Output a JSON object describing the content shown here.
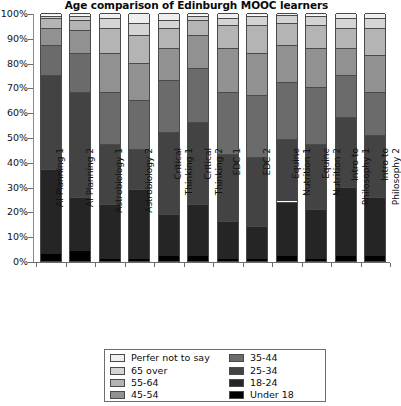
{
  "chart_data": {
    "type": "bar",
    "subtype": "stacked-percentage",
    "title": "Age comparison of Edinburgh MOOC learners",
    "xlabel": "",
    "ylabel": "",
    "ylim": [
      0,
      100
    ],
    "ytick_labels": [
      "100%",
      "90%",
      "80%",
      "70%",
      "60%",
      "50%",
      "40%",
      "30%",
      "20%",
      "10%",
      "0%"
    ],
    "ytick_values": [
      100,
      90,
      80,
      70,
      60,
      50,
      40,
      30,
      20,
      10,
      0
    ],
    "grid": false,
    "legend_position": "bottom",
    "categories": [
      "AI Planning 1",
      "AI Planning 2",
      "Astrobiology 1",
      "Astrobiology 2",
      "Critical Thinking 1",
      "Critical Thinking 2",
      "EDC 1",
      "EDC 2",
      "Equine Nutrition 1",
      "Equine Nutrition 2",
      "Intro to Philosophy 1",
      "Intro to Philosophy 2"
    ],
    "series": [
      {
        "name": "Under 18",
        "color": "#000000",
        "values": [
          3,
          4,
          1,
          1,
          2,
          2,
          1,
          1,
          2,
          1,
          2,
          2
        ]
      },
      {
        "name": "18-24",
        "color": "#252525",
        "values": [
          34,
          22,
          22,
          28,
          17,
          21,
          15,
          13,
          22,
          20,
          28,
          24
        ]
      },
      {
        "name": "25-34",
        "color": "#434343",
        "values": [
          38,
          42,
          24,
          16,
          33,
          33,
          27,
          28,
          25,
          26,
          28,
          25
        ]
      },
      {
        "name": "35-44",
        "color": "#6b6b6b",
        "values": [
          12,
          16,
          21,
          20,
          21,
          22,
          25,
          25,
          23,
          23,
          17,
          17
        ]
      },
      {
        "name": "45-54",
        "color": "#919191",
        "values": [
          7,
          9,
          16,
          15,
          13,
          13,
          18,
          17,
          15,
          16,
          11,
          15
        ]
      },
      {
        "name": "55-64",
        "color": "#b4b4b4",
        "values": [
          4,
          4,
          10,
          11,
          8,
          6,
          9,
          11,
          9,
          9,
          8,
          11
        ]
      },
      {
        "name": "65 over",
        "color": "#d4d4d4",
        "values": [
          1,
          2,
          4,
          5,
          3,
          2,
          3,
          4,
          3,
          4,
          4,
          4
        ]
      },
      {
        "name": "Perfer not to say",
        "color": "#efefef",
        "values": [
          1,
          1,
          2,
          4,
          3,
          1,
          2,
          1,
          1,
          1,
          2,
          2
        ]
      }
    ],
    "legend_column_left": [
      "Perfer not to say",
      "65 over",
      "55-64",
      "45-54"
    ],
    "legend_column_right": [
      "35-44",
      "25-34",
      "18-24",
      "Under 18"
    ]
  }
}
